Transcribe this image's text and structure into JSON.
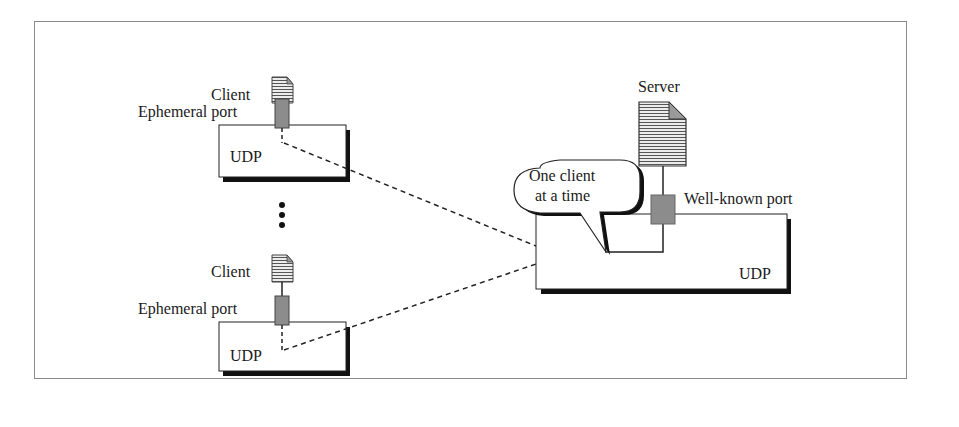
{
  "diagram": {
    "type": "udp-server-iterative",
    "clients": [
      {
        "label": "Client",
        "port_label": "Ephemeral port",
        "protocol_label": "UDP"
      },
      {
        "label": "Client",
        "port_label": "Ephemeral port",
        "protocol_label": "UDP"
      }
    ],
    "ellipsis": "⋮",
    "server": {
      "label": "Server",
      "port_label": "Well-known port",
      "protocol_label": "UDP",
      "callout": {
        "line1": "One client",
        "line2": "at a time"
      }
    },
    "colors": {
      "port_fill": "#8c8c8c",
      "doc_fill": "#d9d9d9",
      "shadow": "#111111",
      "frame_border": "#8a8a8a"
    }
  }
}
